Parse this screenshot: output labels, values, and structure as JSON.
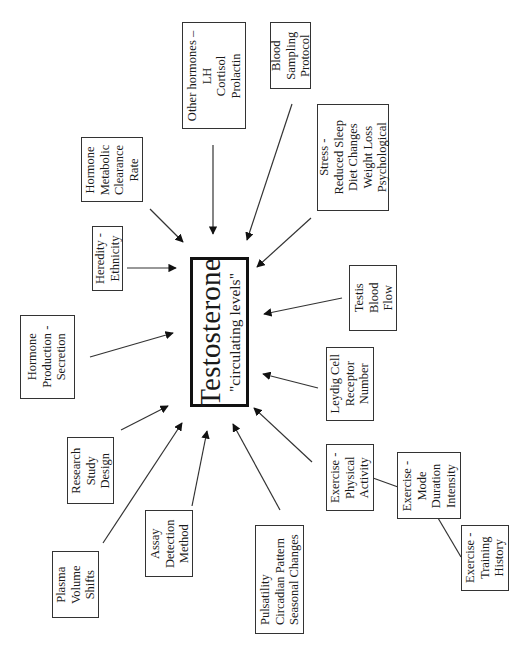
{
  "diagram": {
    "center": {
      "title": "Testosterone",
      "subtitle": "\"circulating levels\""
    },
    "factors": {
      "other_hormones": [
        "Other hormones –",
        "LH",
        "Cortisol",
        "Prolactin"
      ],
      "blood_sampling": [
        "Blood",
        "Sampling",
        "Protocol"
      ],
      "stress": [
        "Stress -",
        "Reduced Sleep",
        "Diet Changes",
        "Weight Loss",
        "Psychological"
      ],
      "hormone_clearance": [
        "Hormone",
        "Metabolic",
        "Clearance",
        "Rate"
      ],
      "heredity": [
        "Heredity -",
        "Ethnicity"
      ],
      "hormone_production": [
        "Hormone",
        "Production -",
        "Secretion"
      ],
      "testis_blood_flow": [
        "Testis",
        "Blood",
        "Flow"
      ],
      "leydig_cell": [
        "Leydig Cell",
        "Receptor",
        "Number"
      ],
      "research_design": [
        "Research",
        "Study",
        "Design"
      ],
      "plasma_volume": [
        "Plasma",
        "Volume",
        "Shifts"
      ],
      "assay_method": [
        "Assay",
        "Detection",
        "Method"
      ],
      "pulsatility": [
        "Pulsatility",
        "Circadian Pattern",
        "Seasonal Changes"
      ],
      "exercise_physical": [
        "Exercise -",
        "Physical",
        "Activity"
      ],
      "exercise_mode": [
        "Exercise -",
        "Mode",
        "Duration",
        "Intensity"
      ],
      "exercise_training": [
        "Exercise -",
        "Training",
        "History"
      ]
    },
    "colors": {
      "line": "#333333",
      "box_border": "#333333",
      "center_border": "#111111",
      "background": "#ffffff"
    }
  }
}
